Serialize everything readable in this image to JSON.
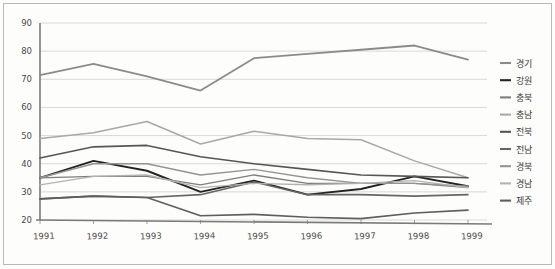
{
  "chart_data": {
    "type": "line",
    "title": "",
    "subtitle": "",
    "xlabel": "",
    "ylabel": "",
    "categories": [
      "1991",
      "1992",
      "1993",
      "1994",
      "1995",
      "1996",
      "1997",
      "1998",
      "1999"
    ],
    "x": [
      1991,
      1992,
      1993,
      1994,
      1995,
      1996,
      1997,
      1998,
      1999
    ],
    "ylim": [
      20,
      90
    ],
    "yticks": [
      20,
      30,
      40,
      50,
      60,
      70,
      80,
      90
    ],
    "ytick_labels": [
      "20",
      "30",
      "40",
      "50",
      "60",
      "70",
      "80",
      "90"
    ],
    "grid": true,
    "legend_position": "right",
    "series": [
      {
        "name": "경기",
        "color": "#8b8b89",
        "width": 1.8,
        "values": [
          71.5,
          75.5,
          71.0,
          66.0,
          77.5,
          79.0,
          80.5,
          82.0,
          77.0
        ]
      },
      {
        "name": "강원",
        "color": "#242424",
        "width": 1.9,
        "values": [
          35.0,
          41.0,
          37.5,
          30.0,
          34.0,
          29.0,
          31.0,
          35.5,
          32.0
        ]
      },
      {
        "name": "충북",
        "color": "#7e7e7c",
        "width": 1.3,
        "values": [
          35.0,
          35.5,
          35.5,
          32.5,
          36.0,
          33.0,
          33.0,
          33.0,
          31.5
        ]
      },
      {
        "name": "충남",
        "color": "#a8a8a6",
        "width": 1.5,
        "values": [
          49.0,
          51.0,
          55.0,
          47.0,
          51.5,
          49.0,
          48.5,
          41.0,
          35.0
        ]
      },
      {
        "name": "전북",
        "color": "#565654",
        "width": 1.6,
        "values": [
          42.0,
          46.0,
          46.5,
          42.5,
          40.0,
          38.0,
          36.0,
          35.5,
          35.0
        ]
      },
      {
        "name": "전남",
        "color": "#666664",
        "width": 1.6,
        "values": [
          27.5,
          28.5,
          28.0,
          29.0,
          33.5,
          29.0,
          29.0,
          28.5,
          29.0
        ]
      },
      {
        "name": "경북",
        "color": "#949492",
        "width": 1.4,
        "values": [
          35.0,
          40.0,
          40.0,
          36.0,
          38.0,
          35.0,
          33.0,
          33.0,
          32.0
        ]
      },
      {
        "name": "경남",
        "color": "#b2b2b0",
        "width": 1.4,
        "values": [
          32.5,
          35.5,
          36.0,
          31.5,
          33.0,
          32.5,
          33.0,
          34.0,
          31.5
        ]
      },
      {
        "name": "제주",
        "color": "#5e5e5c",
        "width": 1.6,
        "values": [
          27.5,
          28.5,
          28.0,
          21.5,
          22.0,
          21.0,
          20.5,
          22.5,
          23.5
        ]
      }
    ]
  },
  "legend": {
    "items": [
      {
        "label": "경기",
        "color": "#8b8b89"
      },
      {
        "label": "강원",
        "color": "#242424"
      },
      {
        "label": "충북",
        "color": "#7e7e7c"
      },
      {
        "label": "충남",
        "color": "#a8a8a6"
      },
      {
        "label": "전북",
        "color": "#565654"
      },
      {
        "label": "전남",
        "color": "#666664"
      },
      {
        "label": "경북",
        "color": "#949492"
      },
      {
        "label": "경남",
        "color": "#b2b2b0"
      },
      {
        "label": "제주",
        "color": "#5e5e5c"
      }
    ]
  },
  "colors": {
    "background": "#fdfdfc",
    "grid": "#c9c9c6",
    "axis": "#7a7a78",
    "text": "#4a4a48",
    "page_border": "#b9b9b7"
  }
}
